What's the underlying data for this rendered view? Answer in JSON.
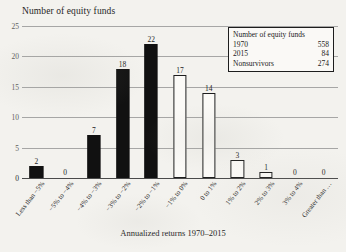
{
  "chart_data": {
    "type": "bar",
    "title": "Number of equity funds",
    "xlabel": "Annualized returns 1970–2015",
    "ylabel": "Number of equity funds",
    "ylim": [
      0,
      25
    ],
    "yticks": [
      0,
      5,
      10,
      15,
      20,
      25
    ],
    "grid": true,
    "legend_position": "inside-top-right",
    "categories": [
      "Less than −5%",
      "−5% to −4%",
      "−4% to −3%",
      "−3% to −2%",
      "−2% to −1%",
      "−1% to 0%",
      "0 to 1%",
      "1% to 2%",
      "2% to 3%",
      "3% to 4%",
      "Greater than …"
    ],
    "values": [
      2,
      0,
      7,
      18,
      22,
      17,
      14,
      3,
      1,
      0,
      0
    ],
    "bar_styles": [
      "filled",
      "filled",
      "filled",
      "filled",
      "filled",
      "hollow",
      "hollow",
      "hollow",
      "hollow",
      "hollow",
      "hollow"
    ],
    "colors": {
      "filled_bar": "#111111",
      "hollow_bar_fill": "#fbfaf7",
      "bar_outline": "#1d1d1d",
      "gridline": "#8d8d8d",
      "background": "#f3f2ee"
    }
  },
  "legend": {
    "title": "Number of equity funds",
    "rows": [
      {
        "label": "1970",
        "value": "558"
      },
      {
        "label": "2015",
        "value": "84"
      },
      {
        "label": "Nonsurvivors",
        "value": "274"
      }
    ]
  }
}
